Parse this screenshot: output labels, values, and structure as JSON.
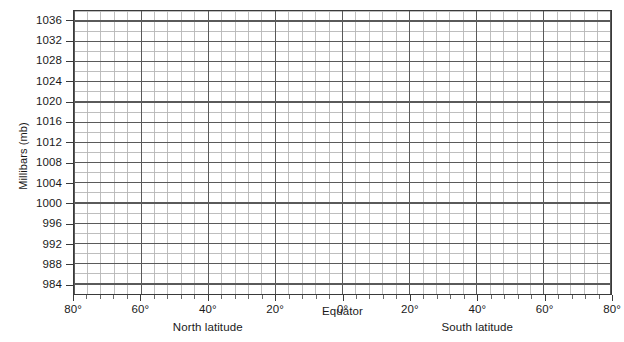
{
  "chart_data": {
    "type": "line",
    "title": "",
    "subtitle": "",
    "xlabel": "Latitude",
    "ylabel": "Millibars (mb)",
    "grid": true,
    "legend": "none",
    "note": "Blank plotting grid — no data series are drawn in the figure.",
    "series": [],
    "ylim": [
      982,
      1038
    ],
    "y_major_step": 4,
    "y_minor_per_major": 2,
    "y_ticks": [
      1036,
      1032,
      1028,
      1024,
      1020,
      1016,
      1012,
      1008,
      1004,
      1000,
      996,
      992,
      988,
      984
    ],
    "y_tick_labels": [
      "1036",
      "1032",
      "1028",
      "1024",
      "1020",
      "1016",
      "1012",
      "1008",
      "1004",
      "1000",
      "996",
      "992",
      "988",
      "984"
    ],
    "xlim": [
      -80,
      80
    ],
    "x_major_step": 20,
    "x_minor_per_major": 5,
    "x_ticks": [
      -80,
      -60,
      -40,
      -20,
      0,
      20,
      40,
      60,
      80
    ],
    "x_tick_labels": [
      "80°",
      "60°",
      "40°",
      "20°",
      "0°",
      "20°",
      "40°",
      "60°",
      "80°"
    ],
    "x_region_labels": [
      {
        "text": "North latitude",
        "at": -40
      },
      {
        "text": "Equator",
        "at": 0
      },
      {
        "text": "South latitude",
        "at": 40
      }
    ]
  },
  "axes": {
    "y_title": "Millibars (mb)"
  },
  "colors": {
    "background": "#ffffff",
    "frame": "#3a3a3a",
    "grid_major": "#5a5a5a",
    "grid_minor": "#b6b6b6",
    "text": "#1a1a1a"
  }
}
